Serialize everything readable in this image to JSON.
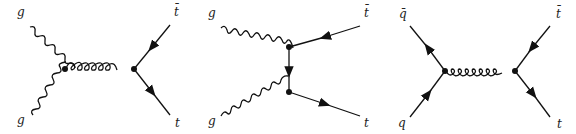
{
  "diagrams": [
    {
      "name": "s-channel gluon fusion",
      "labels": {
        "in_top": "g",
        "in_bottom": "g",
        "out_top": "t̄",
        "out_bottom": "t"
      }
    },
    {
      "name": "t-channel gluon fusion",
      "labels": {
        "in_top": "g",
        "in_bottom": "g",
        "out_top": "t̄",
        "out_bottom": "t"
      }
    },
    {
      "name": "quark-antiquark annihilation",
      "labels": {
        "in_top": "q̄",
        "in_bottom": "q",
        "out_top": "t̄",
        "out_bottom": "t"
      }
    }
  ],
  "colors": {
    "line": "#111111",
    "background": "#ffffff"
  }
}
